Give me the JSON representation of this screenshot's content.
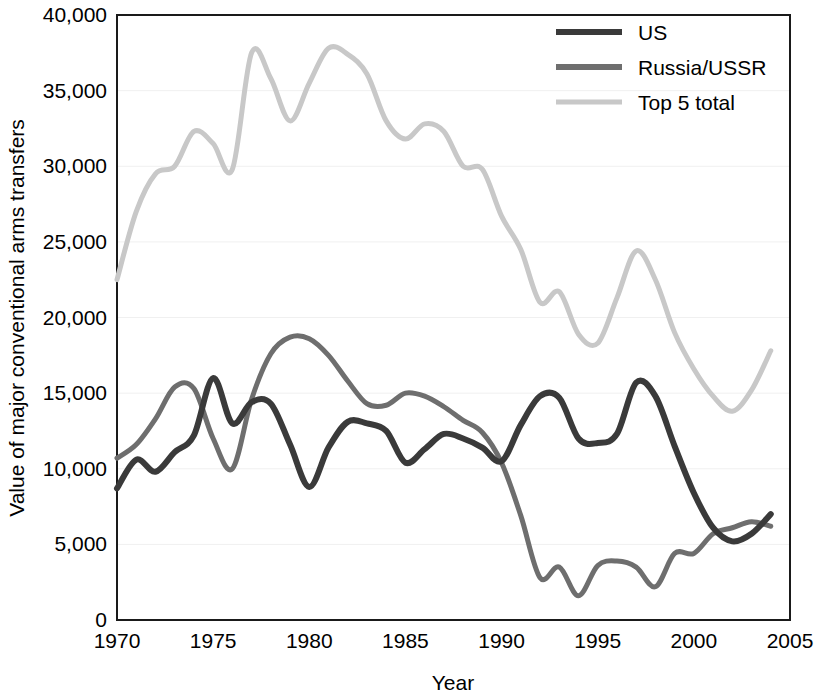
{
  "chart_data": {
    "type": "line",
    "title": "",
    "xlabel": "Year",
    "ylabel": "Value of major conventional arms transfers",
    "xlim": [
      1970,
      2005
    ],
    "ylim": [
      0,
      40000
    ],
    "grid": true,
    "legend_position": "top-right",
    "x_ticks": [
      "1970",
      "1975",
      "1980",
      "1985",
      "1990",
      "1995",
      "2000",
      "2005"
    ],
    "x_tick_values": [
      1970,
      1975,
      1980,
      1985,
      1990,
      1995,
      2000,
      2005
    ],
    "y_ticks": [
      "0",
      "5,000",
      "10,000",
      "15,000",
      "20,000",
      "25,000",
      "30,000",
      "35,000",
      "40,000"
    ],
    "y_tick_values": [
      0,
      5000,
      10000,
      15000,
      20000,
      25000,
      30000,
      35000,
      40000
    ],
    "x": [
      1970,
      1971,
      1972,
      1973,
      1974,
      1975,
      1976,
      1977,
      1978,
      1979,
      1980,
      1981,
      1982,
      1983,
      1984,
      1985,
      1986,
      1987,
      1988,
      1989,
      1990,
      1991,
      1992,
      1993,
      1994,
      1995,
      1996,
      1997,
      1998,
      1999,
      2000,
      2001,
      2002,
      2003,
      2004
    ],
    "series": [
      {
        "name": "US",
        "color": "#3a3a3a",
        "values": [
          8700,
          10600,
          9800,
          11100,
          12200,
          16000,
          13000,
          14400,
          14300,
          11600,
          8800,
          11400,
          13100,
          13000,
          12500,
          10400,
          11300,
          12300,
          12000,
          11400,
          10500,
          12900,
          14800,
          14700,
          12000,
          11700,
          12300,
          15700,
          14800,
          11500,
          8400,
          6100,
          5200,
          5700,
          7000
        ]
      },
      {
        "name": "Russia/USSR",
        "color": "#6e6e6e",
        "values": [
          10700,
          11600,
          13300,
          15400,
          15300,
          12000,
          10000,
          14600,
          17600,
          18700,
          18600,
          17500,
          15800,
          14300,
          14200,
          15000,
          14800,
          14100,
          13200,
          12400,
          10400,
          6900,
          2800,
          3500,
          1600,
          3600,
          3900,
          3500,
          2200,
          4400,
          4400,
          5700,
          6100,
          6500,
          6200
        ]
      },
      {
        "name": "Top 5 total",
        "color": "#c8c8c8",
        "values": [
          22500,
          27000,
          29500,
          30000,
          32300,
          31500,
          29800,
          37500,
          35800,
          33000,
          35500,
          37800,
          37400,
          36100,
          33000,
          31800,
          32800,
          32300,
          30000,
          29800,
          26700,
          24500,
          21000,
          21700,
          18900,
          18300,
          21300,
          24400,
          22500,
          19000,
          16600,
          14800,
          13800,
          15200,
          17800
        ]
      }
    ]
  }
}
